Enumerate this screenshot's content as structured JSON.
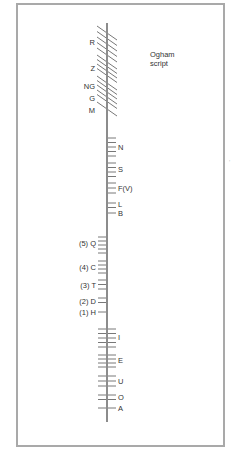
{
  "title": {
    "line1": "Ogham",
    "line2": "script"
  },
  "colors": {
    "frame": "#a9a9a9",
    "stem": "#8c8c8c",
    "stroke": "#555555",
    "text": "#333333"
  },
  "stem": {
    "x": 107,
    "y1": 23,
    "y2": 422
  },
  "groups": [
    {
      "label": "R",
      "type": "diagonal",
      "strokes": [
        33,
        38.5,
        44,
        49.5,
        55
      ],
      "label_y": 45
    },
    {
      "label": "Z",
      "type": "diagonal",
      "strokes": [
        62,
        66.5,
        71,
        75.5
      ],
      "label_y": 71
    },
    {
      "label": "NG",
      "type": "diagonal",
      "strokes": [
        83,
        87.5,
        92
      ],
      "label_y": 89
    },
    {
      "label": "G",
      "type": "diagonal",
      "strokes": [
        97,
        101.5
      ],
      "label_y": 101
    },
    {
      "label": "M",
      "type": "diagonal",
      "strokes": [
        109
      ],
      "label_y": 113
    },
    {
      "label": "N",
      "type": "right",
      "strokes": [
        138,
        142.5,
        147,
        151.5,
        156
      ],
      "label_y": 150
    },
    {
      "label": "S",
      "type": "right",
      "strokes": [
        163,
        167.5,
        172,
        176.5
      ],
      "label_y": 172
    },
    {
      "label": "F(V)",
      "type": "right",
      "strokes": [
        183,
        188,
        193
      ],
      "label_y": 191
    },
    {
      "label": "L",
      "type": "right",
      "strokes": [
        203,
        207.5
      ],
      "label_y": 207
    },
    {
      "label": "B",
      "type": "right",
      "strokes": [
        213
      ],
      "label_y": 216
    },
    {
      "label": "(5) Q",
      "type": "left",
      "strokes": [
        237,
        241,
        245,
        249,
        253
      ],
      "label_y": 246
    },
    {
      "label": "(4) C",
      "type": "left",
      "strokes": [
        261,
        265,
        269,
        273
      ],
      "label_y": 270
    },
    {
      "label": "(3) T",
      "type": "left",
      "strokes": [
        280,
        284.5,
        289
      ],
      "label_y": 288
    },
    {
      "label": "(2) D",
      "type": "left",
      "strokes": [
        298,
        302.5
      ],
      "label_y": 304
    },
    {
      "label": "(1) H",
      "type": "left",
      "strokes": [
        312
      ],
      "label_y": 315
    },
    {
      "label": "I",
      "type": "cross",
      "strokes": [
        329,
        333.5,
        338,
        342.5,
        347
      ],
      "label_y": 340
    },
    {
      "label": "E",
      "type": "cross",
      "strokes": [
        355,
        359,
        363,
        367
      ],
      "label_y": 363
    },
    {
      "label": "U",
      "type": "cross",
      "strokes": [
        376,
        381,
        386
      ],
      "label_y": 384
    },
    {
      "label": "O",
      "type": "cross",
      "strokes": [
        395,
        399.5
      ],
      "label_y": 400
    },
    {
      "label": "A",
      "type": "cross",
      "strokes": [
        408
      ],
      "label_y": 411
    }
  ]
}
